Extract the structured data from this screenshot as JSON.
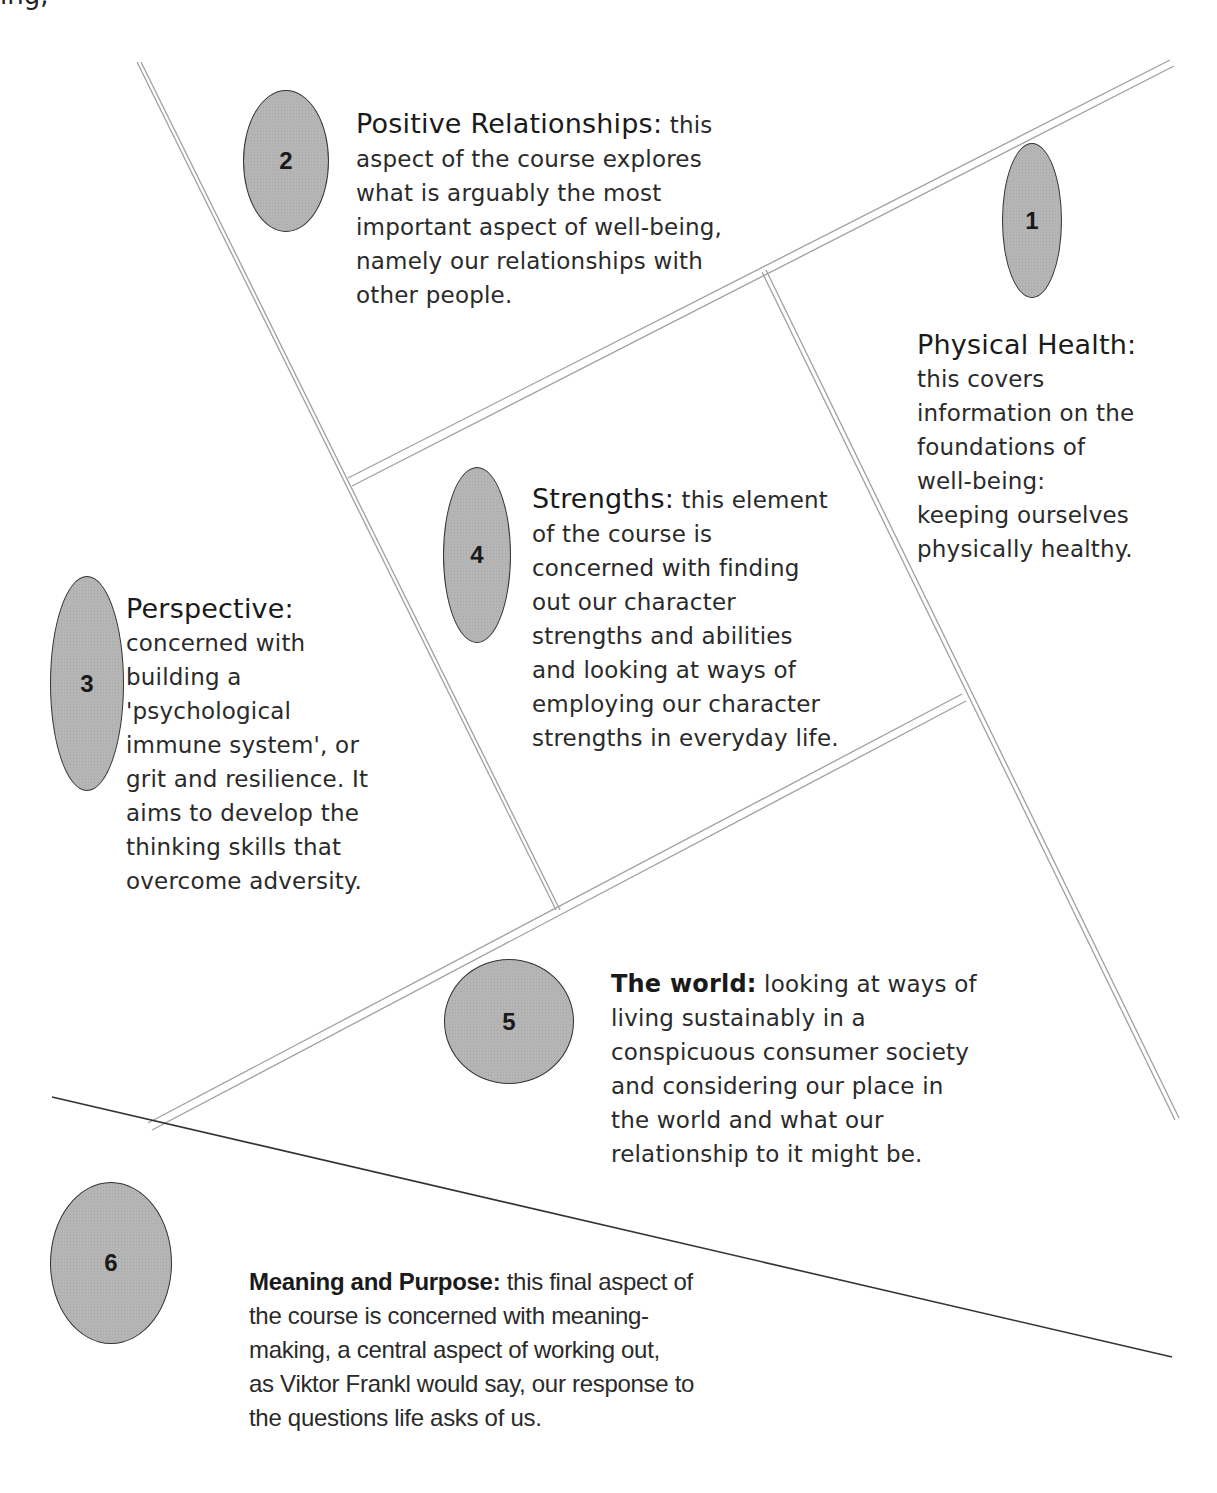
{
  "top_fragment": "ing,",
  "lines": {
    "double_line_color": "#9a9a9a",
    "solid_line_color": "#333333"
  },
  "items": [
    {
      "number": "1",
      "title": "Physical Health:",
      "lines": [
        "this covers",
        "information on the",
        "foundations of",
        "well-being:",
        "keeping ourselves",
        "physically healthy."
      ]
    },
    {
      "number": "2",
      "title": "Positive Relationships:",
      "first_line_rest": " this",
      "lines": [
        "aspect of the course explores",
        "what is arguably the most",
        "important aspect of well-being,",
        "namely our relationships with",
        "other people."
      ]
    },
    {
      "number": "3",
      "title": "Perspective:",
      "lines": [
        "concerned with",
        "building a",
        "'psychological",
        "immune system', or",
        "grit and resilience. It",
        "aims to develop the",
        "thinking skills that",
        "overcome adversity."
      ]
    },
    {
      "number": "4",
      "title": "Strengths:",
      "first_line_rest": " this element",
      "lines": [
        "of the course is",
        "concerned with finding",
        "out our character",
        "strengths and abilities",
        "and looking at ways of",
        "employing our character",
        "strengths in everyday life."
      ]
    },
    {
      "number": "5",
      "title": "The world:",
      "first_line_rest": " looking at ways of",
      "lines": [
        "living sustainably in a",
        "conspicuous consumer society",
        "and considering our place in",
        "the world and what our",
        "relationship to it might be."
      ]
    },
    {
      "number": "6",
      "title": "Meaning and Purpose:",
      "first_line_rest": " this final aspect of",
      "lines": [
        "the course is concerned with meaning-",
        "making, a central aspect of working out,",
        "as Viktor Frankl would say, our response to",
        "the questions life asks of us."
      ]
    }
  ]
}
